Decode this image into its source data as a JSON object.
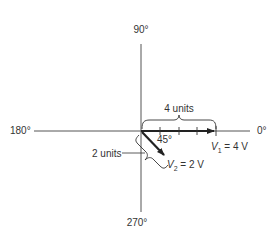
{
  "diagram": {
    "type": "phasor-diagram",
    "axes": {
      "top_label": "90°",
      "bottom_label": "270°",
      "left_label": "180°",
      "right_label": "0°"
    },
    "vectors": [
      {
        "name": "V1",
        "symbol": "V",
        "subscript": "1",
        "equation_rest": " = 4 V",
        "magnitude_units": 4,
        "angle_deg": 0,
        "dimension_label": "4 units"
      },
      {
        "name": "V2",
        "symbol": "V",
        "subscript": "2",
        "equation_rest": " = 2 V",
        "magnitude_units": 2,
        "angle_deg": -45,
        "dimension_label": "2 units"
      }
    ],
    "angle_label": "45°",
    "colors": {
      "axis": "#555555",
      "vector": "#222222",
      "text": "#333333"
    }
  }
}
